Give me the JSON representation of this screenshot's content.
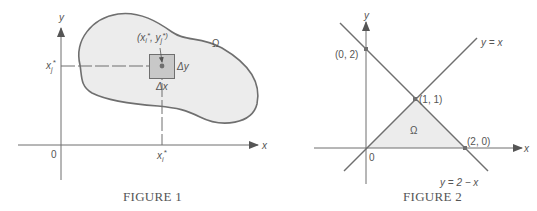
{
  "figure1": {
    "caption": "FIGURE 1",
    "axis_x_label": "x",
    "axis_y_label": "y",
    "origin_label": "0",
    "region_label": "Ω",
    "point_label": "(x_i*, y_j*)",
    "point_label_parts": {
      "open": "(x",
      "sub_i": "i",
      "star1": "*",
      "comma": ", y",
      "sub_j": "j",
      "star2": "*)"
    },
    "y_tick_label": "x_j*",
    "y_tick_parts": {
      "base": "x",
      "sub": "j",
      "star": "*"
    },
    "x_tick_label": "x_i*",
    "x_tick_parts": {
      "base": "x",
      "sub": "i",
      "star": "*"
    },
    "delta_x_label": "Δx",
    "delta_y_label": "Δy",
    "colors": {
      "line": "#6f6f6f",
      "region_fill": "#ececec",
      "cell_fill": "#c8c8c8",
      "text": "#555555"
    }
  },
  "figure2": {
    "caption": "FIGURE 2",
    "axis_x_label": "x",
    "axis_y_label": "y",
    "origin_label": "0",
    "region_label": "Ω",
    "line1_label": "y = x",
    "line2_label": "y = 2 − x",
    "points": [
      {
        "label": "(0, 2)",
        "x": 0,
        "y": 2
      },
      {
        "label": "(1, 1)",
        "x": 1,
        "y": 1
      },
      {
        "label": "(2, 0)",
        "x": 2,
        "y": 0
      }
    ],
    "colors": {
      "line": "#6f6f6f",
      "region_fill": "#ececec",
      "text": "#555555"
    }
  }
}
